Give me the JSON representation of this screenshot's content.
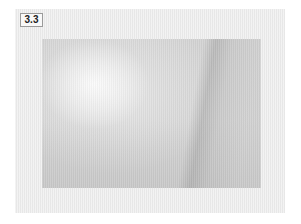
{
  "figure": {
    "label": "3.3",
    "image_description": "grayscale clinical photograph",
    "colors": {
      "frame_background": "#ececec",
      "label_border": "#9a9a9a",
      "image_base": "#d3d3d3"
    }
  }
}
